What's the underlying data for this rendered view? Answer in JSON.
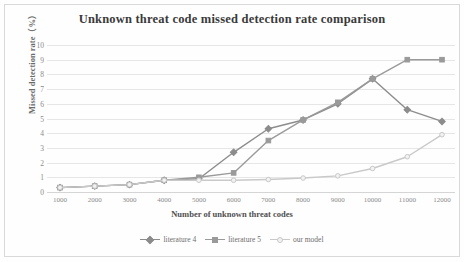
{
  "chart_data": {
    "type": "line",
    "title": "Unknown threat code missed detection rate comparison",
    "xlabel": "Number of unknown threat codes",
    "ylabel": "Missed detection rate（%）",
    "categories": [
      1000,
      2000,
      3000,
      4000,
      5000,
      6000,
      7000,
      8000,
      9000,
      10000,
      11000,
      12000
    ],
    "xticklabels": [
      "1000",
      "2000",
      "3000",
      "4000",
      "5000",
      "6000",
      "7000",
      "8000",
      "9000",
      "10000",
      "11000",
      "12000"
    ],
    "yticklabels": [
      "10",
      "9",
      "8",
      "7",
      "6",
      "5",
      "4",
      "3",
      "2",
      "1",
      "0"
    ],
    "yticks": [
      10,
      9,
      8,
      7,
      6,
      5,
      4,
      3,
      2,
      1,
      0
    ],
    "ylim": [
      0,
      10
    ],
    "grid": true,
    "legend_position": "bottom",
    "series": [
      {
        "name": "literature 4",
        "color": "#8c8c8c",
        "marker": "diamond",
        "values": [
          0.3,
          0.4,
          0.5,
          0.8,
          0.9,
          2.7,
          4.3,
          4.9,
          6.0,
          7.7,
          5.6,
          4.8
        ]
      },
      {
        "name": "literature 5",
        "color": "#9a9a9a",
        "marker": "square",
        "values": [
          0.3,
          0.4,
          0.5,
          0.8,
          1.0,
          1.3,
          3.5,
          4.9,
          6.1,
          7.7,
          9.0,
          9.0
        ]
      },
      {
        "name": "our model",
        "color": "#c9c9c9",
        "marker": "circle",
        "values": [
          0.3,
          0.4,
          0.5,
          0.8,
          0.8,
          0.8,
          0.85,
          0.95,
          1.1,
          1.6,
          2.4,
          3.9
        ]
      }
    ]
  },
  "colors": {
    "background": "#ffffff",
    "grid": "#e6e6e6",
    "title_text": "#3a3a3a",
    "axis_text": "#8a8a8a",
    "border": "#d9d9d9"
  }
}
